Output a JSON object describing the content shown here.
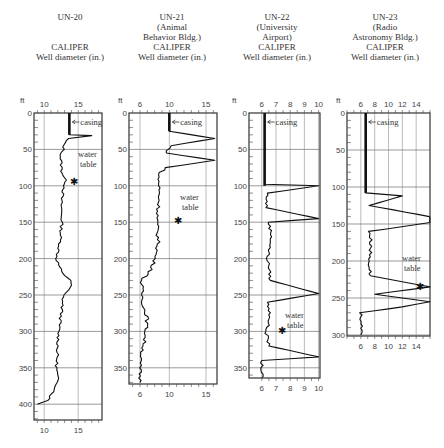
{
  "chart_data": [
    {
      "type": "line",
      "well": "UN-20",
      "location": "",
      "title": "CALIPER",
      "xlabel": "Well diameter (in.)",
      "ylabel": "ft",
      "x_ticks_top": [
        "10",
        "15"
      ],
      "x_ticks_bottom": [
        "10",
        "15"
      ],
      "y_ticks": [
        "0",
        "50",
        "100",
        "150",
        "200",
        "250",
        "300",
        "350",
        "400"
      ],
      "xlim": [
        8.5,
        18.5
      ],
      "ylim": [
        0,
        420
      ],
      "annotations": [
        "casing",
        "water table"
      ],
      "casing_depth_ft": 30,
      "water_table_ft": 95,
      "series": [
        {
          "name": "diameter",
          "depth": [
            0,
            30,
            31,
            35,
            40,
            50,
            60,
            80,
            95,
            100,
            120,
            150,
            180,
            200,
            220,
            230,
            240,
            250,
            270,
            300,
            320,
            350,
            370,
            380,
            395,
            400
          ],
          "values": [
            13.7,
            13.7,
            17.0,
            13.5,
            13.0,
            12.8,
            12.4,
            12.6,
            13.2,
            13.0,
            12.5,
            12.6,
            12.3,
            11.8,
            12.6,
            14.0,
            13.8,
            12.8,
            12.6,
            12.1,
            12.0,
            11.8,
            12.0,
            11.6,
            10.5,
            9.0
          ]
        }
      ]
    },
    {
      "type": "line",
      "well": "UN-21",
      "location": "(Animal Behavior Bldg.)",
      "title": "CALIPER",
      "xlabel": "Well diameter (in.)",
      "ylabel": "ft",
      "x_ticks_top": [
        "6",
        "10",
        "15"
      ],
      "x_ticks_bottom": [
        "6",
        "10",
        "15"
      ],
      "y_ticks": [
        "0",
        "50",
        "100",
        "150",
        "200",
        "250",
        "300",
        "350"
      ],
      "xlim": [
        4.5,
        16.5
      ],
      "ylim": [
        0,
        370
      ],
      "annotations": [
        "casing",
        "water table"
      ],
      "casing_depth_ft": 25,
      "water_table_ft": 148,
      "series": [
        {
          "name": "diameter",
          "depth": [
            0,
            25,
            35,
            45,
            55,
            65,
            75,
            85,
            100,
            120,
            150,
            180,
            200,
            215,
            230,
            250,
            268,
            280,
            300,
            320,
            340,
            350,
            370
          ],
          "values": [
            10,
            10,
            16.2,
            10.2,
            9.6,
            16.2,
            9.5,
            8.5,
            8.6,
            8.6,
            8.3,
            8.5,
            8.0,
            7.6,
            6.2,
            6.3,
            6.5,
            7.0,
            6.8,
            6.5,
            6.0,
            6.0,
            6.0
          ]
        }
      ]
    },
    {
      "type": "line",
      "well": "UN-22",
      "location": "(University Airport)",
      "title": "CALIPER",
      "xlabel": "Well diameter (in.)",
      "ylabel": "ft",
      "x_ticks_top": [
        "6",
        "7",
        "8",
        "9",
        "10"
      ],
      "x_ticks_bottom": [
        "6",
        "7",
        "8",
        "9",
        "10"
      ],
      "y_ticks": [
        "0",
        "50",
        "100",
        "150",
        "200",
        "250",
        "300",
        "350"
      ],
      "xlim": [
        5.1,
        10.1
      ],
      "ylim": [
        0,
        365
      ],
      "annotations": [
        "casing",
        "water table"
      ],
      "casing_depth_ft": 100,
      "water_table_ft": 300,
      "series": [
        {
          "name": "diameter",
          "depth": [
            0,
            98,
            100,
            110,
            130,
            145,
            150,
            170,
            200,
            210,
            230,
            248,
            260,
            280,
            300,
            320,
            335,
            340,
            350,
            365
          ],
          "values": [
            6.2,
            6.2,
            10.0,
            6.4,
            6.3,
            10.0,
            6.5,
            6.7,
            6.4,
            6.5,
            6.6,
            10.0,
            6.4,
            6.6,
            6.3,
            6.5,
            10.0,
            6.0,
            6.0,
            6.0
          ]
        }
      ]
    },
    {
      "type": "line",
      "well": "UN-23",
      "location": "(Radio Astronomy Bldg.)",
      "title": "CALIPER",
      "xlabel": "Well diameter (in.)",
      "ylabel": "ft",
      "x_ticks_top": [
        "6",
        "8",
        "10",
        "12",
        "14"
      ],
      "x_ticks_bottom": [
        "6",
        "8",
        "10",
        "12",
        "14"
      ],
      "y_ticks": [
        "0",
        "50",
        "100",
        "150",
        "200",
        "250",
        "300"
      ],
      "xlim": [
        4,
        16
      ],
      "ylim": [
        0,
        300
      ],
      "annotations": [
        "casing",
        "water table"
      ],
      "casing_depth_ft": 108,
      "water_table_ft": 235,
      "series": [
        {
          "name": "diameter",
          "depth": [
            0,
            108,
            112,
            125,
            140,
            148,
            160,
            180,
            200,
            220,
            235,
            245,
            255,
            262,
            270,
            300
          ],
          "values": [
            6.7,
            6.7,
            12,
            7.2,
            16,
            16,
            7.3,
            7.5,
            7.2,
            7.4,
            16,
            8.0,
            16,
            12,
            6.0,
            6.0
          ]
        }
      ]
    }
  ],
  "wells": [
    {
      "name": "UN-20",
      "sub1": "",
      "sub2": "",
      "caliper": "CALIPER",
      "xlabel": "Well diameter (in.)"
    },
    {
      "name": "UN-21",
      "sub1": "(Animal",
      "sub2": "Behavior Bldg.)",
      "caliper": "CALIPER",
      "xlabel": "Well diameter (in.)"
    },
    {
      "name": "UN-22",
      "sub1": "(University",
      "sub2": "Airport)",
      "caliper": "CALIPER",
      "xlabel": "Well diameter (in.)"
    },
    {
      "name": "UN-23",
      "sub1": "(Radio",
      "sub2": "Astronomy Bldg.)",
      "caliper": "CALIPER",
      "xlabel": "Well diameter (in.)"
    }
  ],
  "labels": {
    "ft": "ft",
    "casing": "casing",
    "water": "water",
    "table": "table"
  }
}
